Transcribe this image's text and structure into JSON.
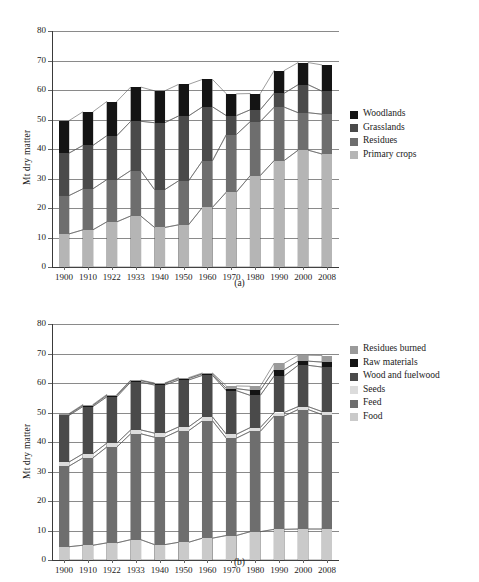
{
  "figure": {
    "caption_a": "(a)",
    "caption_b": "(b)"
  },
  "chart_data": [
    {
      "type": "bar",
      "id": "chart-a",
      "stacked": true,
      "title": "",
      "xlabel": "",
      "ylabel": "Mt dry matter",
      "ylim": [
        0,
        80
      ],
      "yticks": [
        0,
        10,
        20,
        30,
        40,
        50,
        60,
        70,
        80
      ],
      "grid": true,
      "legend_position": "right",
      "categories": [
        "1900",
        "1910",
        "1922",
        "1933",
        "1940",
        "1950",
        "1960",
        "1970",
        "1980",
        "1990",
        "2000",
        "2008"
      ],
      "series": [
        {
          "name": "Primary crops",
          "color": "#b5b5b5",
          "values": [
            11.2,
            12.6,
            15.3,
            17.3,
            13.4,
            14.3,
            20.2,
            25.4,
            31.0,
            36.1,
            39.6,
            38.3
          ]
        },
        {
          "name": "Residues",
          "color": "#6e6e6e",
          "values": [
            24.2,
            26.5,
            29.6,
            32.7,
            26.2,
            29.2,
            36.0,
            44.9,
            49.3,
            54.2,
            52.3,
            51.8
          ]
        },
        {
          "name": "Grasslands",
          "color": "#4a4a4a",
          "values": [
            38.6,
            41.2,
            44.5,
            49.4,
            48.9,
            51.2,
            54.3,
            51.3,
            53.3,
            58.9,
            61.8,
            59.6
          ]
        },
        {
          "name": "Woodlands",
          "color": "#141414",
          "values": [
            49.6,
            52.6,
            56.1,
            61.0,
            59.7,
            61.9,
            63.6,
            58.7,
            58.8,
            66.6,
            69.3,
            68.5
          ]
        }
      ],
      "legend": [
        "Woodlands",
        "Grasslands",
        "Residues",
        "Primary crops"
      ]
    },
    {
      "type": "bar",
      "id": "chart-b",
      "stacked": true,
      "title": "",
      "xlabel": "",
      "ylabel": "Mt dry matter",
      "ylim": [
        0,
        80
      ],
      "yticks": [
        0,
        10,
        20,
        30,
        40,
        50,
        60,
        70,
        80
      ],
      "grid": true,
      "legend_position": "right",
      "categories": [
        "1900",
        "1910",
        "1922",
        "1933",
        "1940",
        "1950",
        "1960",
        "1970",
        "1980",
        "1990",
        "2000",
        "2008"
      ],
      "series": [
        {
          "name": "Food",
          "color": "#cacaca",
          "values": [
            4.5,
            5.0,
            5.8,
            6.9,
            5.2,
            6.0,
            7.4,
            8.3,
            9.6,
            10.4,
            10.5,
            10.5
          ]
        },
        {
          "name": "Feed",
          "color": "#6e6e6e",
          "values": [
            31.8,
            34.6,
            38.3,
            42.8,
            41.6,
            43.8,
            47.2,
            41.3,
            43.6,
            48.8,
            51.0,
            49.3
          ]
        },
        {
          "name": "Seeds",
          "color": "#dcdcdc",
          "values": [
            33.2,
            36.0,
            39.6,
            44.1,
            43.0,
            45.1,
            48.5,
            42.6,
            44.9,
            50.0,
            52.0,
            50.3
          ]
        },
        {
          "name": "Wood and fuelwood",
          "color": "#4a4a4a",
          "values": [
            49.0,
            52.0,
            55.3,
            60.3,
            59.3,
            61.0,
            62.6,
            57.4,
            55.8,
            62.4,
            66.0,
            65.4
          ]
        },
        {
          "name": "Raw materials",
          "color": "#141414",
          "values": [
            49.4,
            52.4,
            55.8,
            60.8,
            59.8,
            61.5,
            63.1,
            58.1,
            57.5,
            64.5,
            67.4,
            67.1
          ]
        },
        {
          "name": "Residues burned",
          "color": "#9a9a9a",
          "values": [
            49.6,
            52.7,
            56.1,
            61.0,
            60.0,
            61.8,
            63.4,
            59.0,
            58.9,
            66.7,
            69.4,
            69.3
          ]
        }
      ],
      "legend": [
        "Residues burned",
        "Raw materials",
        "Wood and fuelwood",
        "Seeds",
        "Feed",
        "Food"
      ]
    }
  ],
  "legend_a": {
    "items": [
      {
        "label": "Woodlands",
        "color": "#141414"
      },
      {
        "label": "Grasslands",
        "color": "#4a4a4a"
      },
      {
        "label": "Residues",
        "color": "#6e6e6e"
      },
      {
        "label": "Primary crops",
        "color": "#b5b5b5"
      }
    ]
  },
  "legend_b": {
    "items": [
      {
        "label": "Residues burned",
        "color": "#9a9a9a"
      },
      {
        "label": "Raw materials",
        "color": "#141414"
      },
      {
        "label": "Wood and fuelwood",
        "color": "#4a4a4a"
      },
      {
        "label": "Seeds",
        "color": "#dcdcdc"
      },
      {
        "label": "Feed",
        "color": "#6e6e6e"
      },
      {
        "label": "Food",
        "color": "#cacaca"
      }
    ]
  }
}
